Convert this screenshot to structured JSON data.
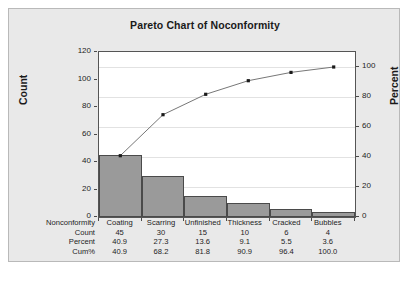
{
  "chart": {
    "title": "Pareto Chart of Noconformity",
    "left_axis_label": "Count",
    "right_axis_label": "Percent"
  },
  "chart_data": {
    "type": "bar",
    "title": "Pareto Chart of Noconformity",
    "xlabel": "",
    "ylabel": "Count",
    "y2label": "Percent",
    "categories": [
      "Coating",
      "Scarring",
      "Unfinished",
      "Thickness",
      "Cracked",
      "Bubbles"
    ],
    "values": [
      45,
      30,
      15,
      10,
      6,
      4
    ],
    "cumulative_percent": [
      40.9,
      68.2,
      81.8,
      90.9,
      96.4,
      100.0
    ],
    "percent": [
      40.9,
      27.3,
      13.6,
      9.1,
      5.5,
      3.6
    ],
    "total_count": 110,
    "ylim": [
      0,
      120
    ],
    "y2lim": [
      0,
      110
    ],
    "yticks": [
      0,
      20,
      40,
      60,
      80,
      100,
      120
    ],
    "y2ticks": [
      0,
      20,
      40,
      60,
      80,
      100
    ],
    "grid": true,
    "legend": "none",
    "series": [
      {
        "name": "Count",
        "type": "bar",
        "values": [
          45,
          30,
          15,
          10,
          6,
          4
        ]
      },
      {
        "name": "Cum%",
        "type": "line",
        "values": [
          40.9,
          68.2,
          81.8,
          90.9,
          96.4,
          100.0
        ]
      }
    ],
    "bar_color": "#9a9a9a",
    "line_color": "#777777",
    "marker_color": "#1a1a1a",
    "background_color": "#e9e9e9",
    "plot_background_color": "#ffffff"
  },
  "axes": {
    "left_ticks": [
      "120",
      "100",
      "80",
      "60",
      "40",
      "20",
      "0"
    ],
    "right_ticks": [
      "100",
      "80",
      "60",
      "40",
      "20",
      "0"
    ]
  },
  "table": {
    "row_labels": [
      "Nonconformity",
      "Count",
      "Percent",
      "Cum%"
    ],
    "categories": [
      "Coating",
      "Scarring",
      "Unfinished",
      "Thickness",
      "Cracked",
      "Bubbles"
    ],
    "count": [
      "45",
      "30",
      "15",
      "10",
      "6",
      "4"
    ],
    "percent": [
      "40.9",
      "27.3",
      "13.6",
      "9.1",
      "5.5",
      "3.6"
    ],
    "cumpct": [
      "40.9",
      "68.2",
      "81.8",
      "90.9",
      "96.4",
      "100.0"
    ]
  }
}
